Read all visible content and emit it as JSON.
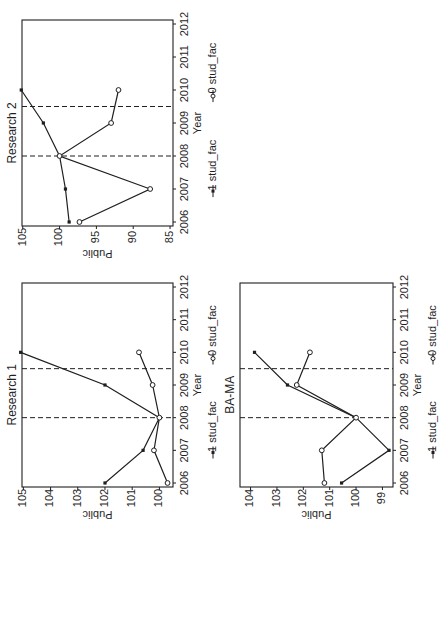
{
  "figure": {
    "background": "#ffffff",
    "line_color": "#1f1f1f",
    "dashed_line_years": [
      2008,
      2009.5
    ]
  },
  "chart_data": [
    {
      "type": "line",
      "title": "Research 2",
      "xlabel": "Year",
      "ylabel": "Public",
      "x": [
        2006,
        2007,
        2008,
        2009,
        2010
      ],
      "xticks": [
        2006,
        2007,
        2008,
        2009,
        2010,
        2011,
        2012
      ],
      "xlim": [
        2006,
        2012
      ],
      "yticks": [
        105,
        100,
        95,
        90,
        85
      ],
      "ylim": [
        84.6,
        105.1
      ],
      "vlines": [
        2008,
        2009.5
      ],
      "series": [
        {
          "name": "1 stud_fac",
          "marker": "filled",
          "values": [
            98.7,
            99.2,
            100,
            102.2,
            105.2
          ]
        },
        {
          "name": "0 stud_fac",
          "marker": "open",
          "values": [
            97.3,
            87.7,
            100,
            93.0,
            92.0
          ]
        }
      ],
      "legend": [
        "1 stud_fac",
        "0 stud_fac"
      ],
      "orientation": "rotated-90-ccw",
      "frame": {
        "left": 22,
        "top": 20,
        "right": 173,
        "bottom": 226
      }
    },
    {
      "type": "line",
      "title": "Research 1",
      "xlabel": "Year",
      "ylabel": "Public",
      "x": [
        2006,
        2007,
        2008,
        2009,
        2010
      ],
      "xticks": [
        2006,
        2007,
        2008,
        2009,
        2010,
        2011,
        2012
      ],
      "xlim": [
        2006,
        2012
      ],
      "yticks": [
        105,
        104,
        103,
        102,
        101,
        100
      ],
      "ylim": [
        99.5,
        105.05
      ],
      "vlines": [
        2008,
        2009.5
      ],
      "series": [
        {
          "name": "1 stud_fac",
          "marker": "filled",
          "values": [
            102.0,
            100.6,
            100,
            102.0,
            105.1
          ]
        },
        {
          "name": "0 stud_fac",
          "marker": "open",
          "values": [
            99.7,
            100.2,
            100,
            100.25,
            100.75
          ]
        }
      ],
      "legend": [
        "1 stud_fac",
        "0 stud_fac"
      ],
      "orientation": "rotated-90-ccw",
      "frame": {
        "left": 22,
        "top": 283,
        "right": 173,
        "bottom": 487
      }
    },
    {
      "type": "line",
      "title": "BA-MA",
      "xlabel": "Year",
      "ylabel": "Public",
      "x": [
        2006,
        2007,
        2008,
        2009,
        2010
      ],
      "xticks": [
        2006,
        2007,
        2008,
        2009,
        2010,
        2011,
        2012
      ],
      "xlim": [
        2006,
        2012
      ],
      "yticks": [
        104,
        103,
        102,
        101,
        100,
        99
      ],
      "ylim": [
        98.6,
        104.4
      ],
      "vlines": [
        2008,
        2009.5
      ],
      "series": [
        {
          "name": "1 stud_fac",
          "marker": "filled",
          "values": [
            100.55,
            98.75,
            100,
            102.6,
            103.85
          ]
        },
        {
          "name": "0 stud_fac",
          "marker": "open",
          "values": [
            101.2,
            101.3,
            100,
            102.25,
            101.75
          ]
        }
      ],
      "legend": [
        "1 stud_fac",
        "0 stud_fac"
      ],
      "orientation": "rotated-90-ccw",
      "frame": {
        "left": 240,
        "top": 283,
        "right": 393,
        "bottom": 487
      }
    }
  ]
}
